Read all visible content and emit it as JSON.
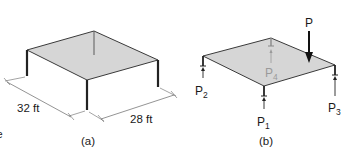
{
  "figure_a": {
    "caption": "(a)",
    "dim_depth": "32 ft",
    "dim_width": "28 ft",
    "slab": {
      "left": [
        27,
        50
      ],
      "top": [
        94,
        31
      ],
      "right": [
        158,
        60
      ],
      "front": [
        87,
        80
      ]
    },
    "columns": {
      "left": {
        "x": 27,
        "y1": 50,
        "y2": 76
      },
      "front": {
        "x": 87,
        "y1": 80,
        "y2": 110
      },
      "right": {
        "x": 158,
        "y1": 60,
        "y2": 87
      },
      "back": {
        "x": 94,
        "y1": 31,
        "y2": 55
      }
    }
  },
  "figure_b": {
    "caption": "(b)",
    "load_label": "P",
    "reactions": [
      {
        "label": "P",
        "sub": "1",
        "corner": "front"
      },
      {
        "label": "P",
        "sub": "2",
        "corner": "left"
      },
      {
        "label": "P",
        "sub": "3",
        "corner": "right"
      },
      {
        "label": "P",
        "sub": "4",
        "corner": "back"
      }
    ],
    "slab": {
      "left": [
        203,
        56
      ],
      "top": [
        271,
        38
      ],
      "right": [
        335,
        65
      ],
      "front": [
        264,
        86
      ]
    }
  },
  "colors": {
    "slab_fill": "#d6d6d6",
    "line": "#2a2a2a",
    "ghost": "#9a9a9a"
  },
  "edge_mark": "e"
}
